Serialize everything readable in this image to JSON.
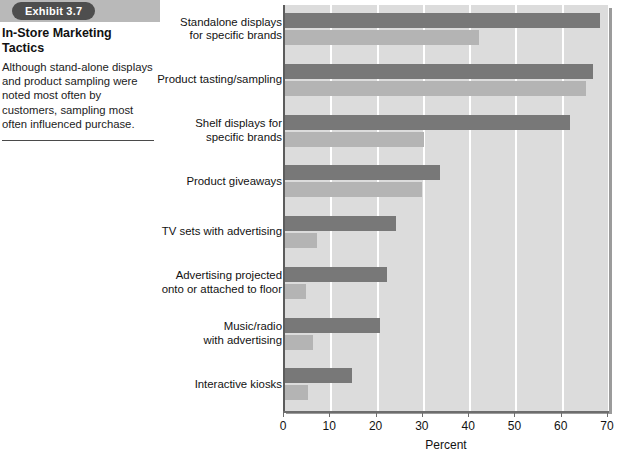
{
  "caption": {
    "exhibit_tab": "Exhibit 3.7",
    "title": "In-Store Marketing Tactics",
    "body": "Although stand-alone displays and product sampling were noted most often by customers, sampling most often influenced purchase."
  },
  "colors": {
    "tab_background": "#4e4e4e",
    "tab_text": "#ffffff",
    "band_background": "#b9b9b9",
    "plot_background": "#dcdcdc",
    "gridline": "#ffffff",
    "bar_dark": "#787878",
    "bar_light": "#b4b4b4",
    "axis": "#6d6d6d"
  },
  "chart_data": {
    "type": "bar",
    "orientation": "horizontal",
    "title": "",
    "xlabel": "Percent",
    "ylabel": "",
    "xlim": [
      0,
      70
    ],
    "xticks": [
      0,
      10,
      20,
      30,
      40,
      50,
      60,
      70
    ],
    "grid": true,
    "legend": null,
    "categories": [
      "Standalone displays for specific brands",
      "Product tasting/sampling",
      "Shelf displays for specific brands",
      "Product giveaways",
      "TV sets with advertising",
      "Advertising projected onto or attached to floor",
      "Music/radio with advertising",
      "Interactive kiosks"
    ],
    "category_lines": [
      [
        "Standalone displays",
        "for specific brands"
      ],
      [
        "Product tasting/sampling"
      ],
      [
        "Shelf displays for",
        "specific brands"
      ],
      [
        "Product giveaways"
      ],
      [
        "TV sets with advertising"
      ],
      [
        "Advertising projected",
        "onto or attached to floor"
      ],
      [
        "Music/radio",
        "with advertising"
      ],
      [
        "Interactive kiosks"
      ]
    ],
    "series": [
      {
        "name": "noted",
        "color": "#787878",
        "values": [
          68,
          66.5,
          61.5,
          33.5,
          24,
          22,
          20.5,
          14.5
        ]
      },
      {
        "name": "influenced purchase",
        "color": "#b4b4b4",
        "values": [
          42,
          65,
          30,
          29.5,
          7,
          4.5,
          6,
          5
        ]
      }
    ]
  }
}
